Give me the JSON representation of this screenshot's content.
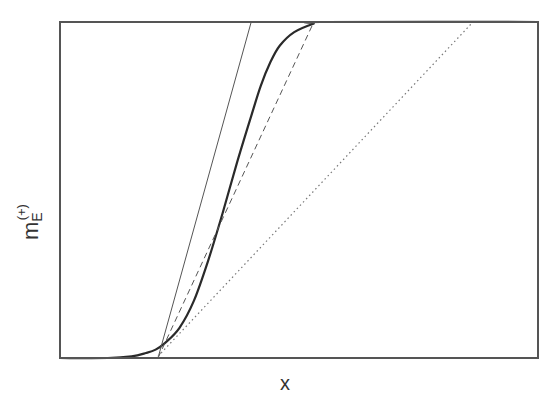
{
  "chart_data": {
    "type": "line",
    "title": "",
    "xlabel": "x",
    "ylabel": {
      "base": "m",
      "subscript": "E",
      "superscript": "(+)"
    },
    "ticks": {
      "x": [],
      "y": []
    },
    "grid": false,
    "legend": null,
    "xlim": [
      0,
      1
    ],
    "ylim": [
      0,
      1
    ],
    "series": [
      {
        "name": "sigmoid curve (thick solid)",
        "style": "solid-thick",
        "color": "#2a2a2a",
        "x": [
          0.0,
          0.1,
          0.15,
          0.18,
          0.2,
          0.22,
          0.25,
          0.28,
          0.31,
          0.34,
          0.37,
          0.4,
          0.42,
          0.44,
          0.46,
          0.49,
          0.53,
          0.55,
          1.0
        ],
        "y": [
          0.0,
          0.0,
          0.005,
          0.015,
          0.025,
          0.045,
          0.09,
          0.17,
          0.29,
          0.43,
          0.58,
          0.72,
          0.81,
          0.88,
          0.93,
          0.97,
          0.995,
          1.0,
          1.0
        ]
      },
      {
        "name": "tangent line (thin solid)",
        "style": "solid-thin",
        "color": "#555555",
        "x": [
          0.205,
          0.4
        ],
        "y": [
          0.0,
          1.0
        ]
      },
      {
        "name": "dashed line",
        "style": "dashed",
        "color": "#555555",
        "x": [
          0.205,
          0.531
        ],
        "y": [
          0.0,
          1.0
        ]
      },
      {
        "name": "dotted line",
        "style": "dotted",
        "color": "#777777",
        "x": [
          0.205,
          0.864
        ],
        "y": [
          0.005,
          1.0
        ]
      }
    ]
  },
  "layout": {
    "plot_left": 60,
    "plot_top": 22,
    "plot_right": 538,
    "plot_bottom": 358,
    "frame_color": "#555555"
  },
  "labels": {
    "x": "x",
    "y_base": "m",
    "y_sub": "E",
    "y_sup": "(+)"
  }
}
